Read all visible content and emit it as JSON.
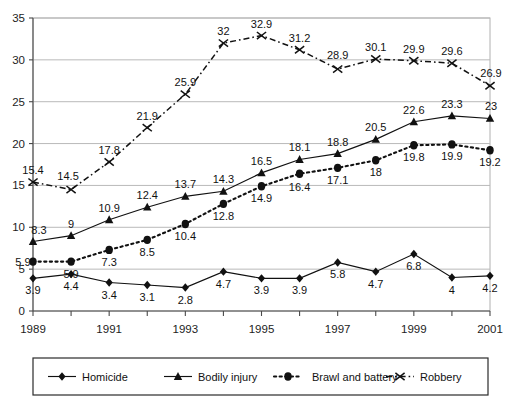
{
  "chart_data": {
    "type": "line",
    "title": "",
    "subtitle": "",
    "xlabel": "",
    "ylabel": "",
    "x": [
      1989,
      1990,
      1991,
      1992,
      1993,
      1994,
      1995,
      1996,
      1997,
      1998,
      1999,
      2000,
      2001
    ],
    "categories": [
      "1989",
      "1990",
      "1991",
      "1992",
      "1993",
      "1994",
      "1995",
      "1996",
      "1997",
      "1998",
      "1999",
      "2000",
      "2001"
    ],
    "xtick_labels": [
      "1989",
      "1991",
      "1993",
      "1995",
      "1997",
      "1999",
      "2001"
    ],
    "ytick_labels": [
      "0",
      "5",
      "10",
      "15",
      "20",
      "25",
      "30",
      "35"
    ],
    "ylim": [
      0,
      35
    ],
    "xlim": [
      1989,
      2001
    ],
    "yticks": [
      0,
      5,
      10,
      15,
      20,
      25,
      30,
      35
    ],
    "grid": "horizontal",
    "legend_position": "bottom",
    "series": [
      {
        "name": "Homicide",
        "marker": "diamond",
        "linestyle": "solid",
        "color": "#111111",
        "values": [
          3.9,
          4.4,
          3.4,
          3.1,
          2.8,
          4.7,
          3.9,
          3.9,
          5.8,
          4.7,
          6.8,
          4,
          4.2
        ],
        "labels": [
          "3.9",
          "4.4",
          "3.4",
          "3.1",
          "2.8",
          "4.7",
          "3.9",
          "3.9",
          "5.8",
          "4.7",
          "6.8",
          "4",
          "4.2"
        ]
      },
      {
        "name": "Bodily injury",
        "marker": "triangle",
        "linestyle": "solid",
        "color": "#111111",
        "values": [
          8.3,
          9,
          10.9,
          12.4,
          13.7,
          14.3,
          16.5,
          18.1,
          18.8,
          20.5,
          22.6,
          23.3,
          23
        ],
        "labels": [
          "8.3",
          "9",
          "10.9",
          "12.4",
          "13.7",
          "14.3",
          "16.5",
          "18.1",
          "18.8",
          "20.5",
          "22.6",
          "23.3",
          "23"
        ]
      },
      {
        "name": "Brawl and battery",
        "marker": "circle",
        "linestyle": "dotted",
        "color": "#111111",
        "values": [
          5.9,
          5.9,
          7.3,
          8.5,
          10.4,
          12.8,
          14.9,
          16.4,
          17.1,
          18,
          19.8,
          19.9,
          19.2
        ],
        "labels": [
          "5.9",
          "5.9",
          "7.3",
          "8.5",
          "10.4",
          "12.8",
          "14.9",
          "16.4",
          "17.1",
          "18",
          "19.8",
          "19.9",
          "19.2"
        ]
      },
      {
        "name": "Robbery",
        "marker": "x",
        "linestyle": "dashdot",
        "color": "#111111",
        "values": [
          15.4,
          14.5,
          17.8,
          21.9,
          25.9,
          32,
          32.9,
          31.2,
          28.9,
          30.1,
          29.9,
          29.6,
          26.9
        ],
        "labels": [
          "15.4",
          "14.5",
          "17.8",
          "21.9",
          "25.9",
          "32",
          "32.9",
          "31.2",
          "28.9",
          "30.1",
          "29.9",
          "29.6",
          "26.9"
        ]
      }
    ]
  },
  "legend": {
    "entries": [
      {
        "label": "Homicide",
        "marker": "diamond"
      },
      {
        "label": "Bodily injury",
        "marker": "triangle"
      },
      {
        "label": "Brawl and battery",
        "marker": "circle"
      },
      {
        "label": "Robbery",
        "marker": "x"
      }
    ]
  }
}
